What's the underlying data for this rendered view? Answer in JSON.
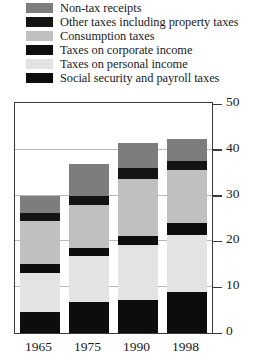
{
  "legend": {
    "position": "above-plot",
    "items": [
      {
        "label": "Non-tax receipts",
        "color": "#7d7d7d",
        "key": "non_tax_receipts"
      },
      {
        "label": "Other taxes including property taxes",
        "color": "#141414",
        "key": "other_taxes"
      },
      {
        "label": "Consumption taxes",
        "color": "#c0c0c0",
        "key": "consumption_taxes"
      },
      {
        "label": "Taxes on corporate income",
        "color": "#0d0d0d",
        "key": "corporate_income"
      },
      {
        "label": "Taxes on personal income",
        "color": "#e3e3e3",
        "key": "personal_income"
      },
      {
        "label": "Social security and payroll taxes",
        "color": "#0d0d0d",
        "key": "social_security"
      }
    ]
  },
  "axis": {
    "y_ticks": [
      "0",
      "10",
      "20",
      "30",
      "40",
      "50"
    ],
    "x_labels": [
      "1965",
      "1975",
      "1990",
      "1998"
    ]
  },
  "chart_data": {
    "type": "bar",
    "stacked": true,
    "title": "",
    "subtitle": "",
    "xlabel": "",
    "ylabel": "",
    "ylim": [
      0,
      50
    ],
    "ytick_values": [
      0,
      10,
      20,
      30,
      40,
      50
    ],
    "ytick_labels": [
      "0",
      "10",
      "20",
      "30",
      "40",
      "50"
    ],
    "y_axis_side": "right",
    "grid": "horizontal",
    "gridline_values": [
      10,
      20,
      30,
      40
    ],
    "legend_position": "above",
    "categories": [
      "1965",
      "1975",
      "1990",
      "1998"
    ],
    "stack_order_bottom_to_top": [
      "Social security and payroll taxes",
      "Taxes on personal income",
      "Taxes on corporate income",
      "Consumption taxes",
      "Other taxes including property taxes",
      "Non-tax receipts"
    ],
    "series": [
      {
        "name": "Social security and payroll taxes",
        "color": "#0d0d0d",
        "values": [
          4.5,
          6.8,
          7.3,
          9.0
        ]
      },
      {
        "name": "Taxes on personal income",
        "color": "#e3e3e3",
        "values": [
          8.5,
          10.0,
          12.0,
          12.5
        ]
      },
      {
        "name": "Taxes on corporate income",
        "color": "#0d0d0d",
        "values": [
          2.0,
          1.8,
          1.9,
          2.5
        ]
      },
      {
        "name": "Consumption taxes",
        "color": "#c0c0c0",
        "values": [
          9.5,
          9.4,
          12.5,
          11.5
        ]
      },
      {
        "name": "Other taxes including property taxes",
        "color": "#141414",
        "values": [
          1.8,
          2.0,
          2.3,
          2.0
        ]
      },
      {
        "name": "Non-tax receipts",
        "color": "#7d7d7d",
        "values": [
          3.7,
          7.0,
          5.5,
          4.8
        ]
      }
    ],
    "totals": [
      30.0,
      37.0,
      41.5,
      42.3
    ]
  }
}
